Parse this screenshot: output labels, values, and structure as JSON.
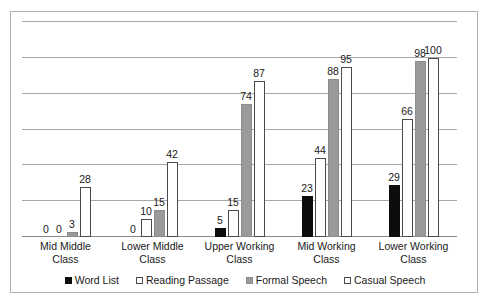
{
  "chart_data": {
    "type": "bar",
    "title": "",
    "subtitle": "",
    "xlabel": "",
    "ylabel": "",
    "ylim": [
      0,
      120
    ],
    "grid": true,
    "gridline_values": [
      0,
      20,
      40,
      60,
      80,
      100,
      120
    ],
    "legend_position": "bottom",
    "show_value_labels": true,
    "categories": [
      "Mid Middle Class",
      "Lower Middle Class",
      "Upper Working Class",
      "Mid Working Class",
      "Lower Working Class"
    ],
    "category_lines": [
      [
        "Mid Middle",
        "Class"
      ],
      [
        "Lower Middle",
        "Class"
      ],
      [
        "Upper Working",
        "Class"
      ],
      [
        "Mid Working",
        "Class"
      ],
      [
        "Lower Working",
        "Class"
      ]
    ],
    "series": [
      {
        "name": "Word List",
        "style": "fill-black",
        "color": "#0d0d0d",
        "values": [
          0,
          0,
          5,
          23,
          29
        ]
      },
      {
        "name": "Reading Passage",
        "style": "fill-white",
        "color": "#ffffff",
        "values": [
          0,
          10,
          15,
          44,
          66
        ]
      },
      {
        "name": "Formal Speech",
        "style": "fill-gray",
        "color": "#9a9a9a",
        "values": [
          3,
          15,
          74,
          88,
          98
        ]
      },
      {
        "name": "Casual Speech",
        "style": "fill-white",
        "color": "#ffffff",
        "values": [
          28,
          42,
          87,
          95,
          100
        ]
      }
    ]
  },
  "legend": {
    "items": [
      {
        "label": "Word List",
        "style": "fill-black"
      },
      {
        "label": "Reading Passage",
        "style": "fill-white"
      },
      {
        "label": "Formal Speech",
        "style": "fill-gray"
      },
      {
        "label": "Casual Speech",
        "style": "fill-white"
      }
    ]
  }
}
